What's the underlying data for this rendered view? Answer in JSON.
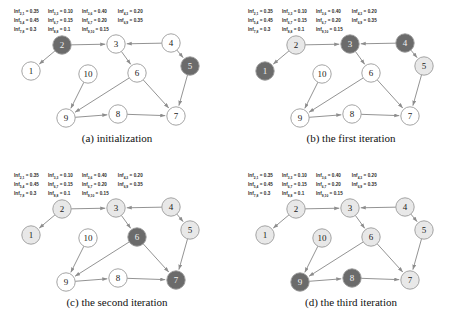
{
  "figure": {
    "node_labels": [
      "1",
      "2",
      "3",
      "4",
      "5",
      "6",
      "7",
      "8",
      "9",
      "10"
    ],
    "edges": [
      {
        "from": "2",
        "to": "1"
      },
      {
        "from": "2",
        "to": "3"
      },
      {
        "from": "4",
        "to": "3"
      },
      {
        "from": "3",
        "to": "6"
      },
      {
        "from": "4",
        "to": "5"
      },
      {
        "from": "6",
        "to": "9"
      },
      {
        "from": "6",
        "to": "7"
      },
      {
        "from": "10",
        "to": "9"
      },
      {
        "from": "9",
        "to": "8"
      },
      {
        "from": "8",
        "to": "7"
      },
      {
        "from": "5",
        "to": "7"
      }
    ]
  },
  "panels": [
    {
      "id": "a",
      "caption": "(a) initialization",
      "active_nodes": [
        "2",
        "5"
      ],
      "faded_nodes": [],
      "weights": [
        {
          "name": "Inf",
          "sub": "2,1",
          "value": "0.35"
        },
        {
          "name": "Inf",
          "sub": "3,3",
          "value": "0.10"
        },
        {
          "name": "Inf",
          "sub": "3,6",
          "value": "0.40"
        },
        {
          "name": "Inf",
          "sub": "4,3",
          "value": "0.20"
        },
        {
          "name": "Inf",
          "sub": "5,4",
          "value": "0.45"
        },
        {
          "name": "Inf",
          "sub": "6,7",
          "value": "0.15"
        },
        {
          "name": "Inf",
          "sub": "6,7",
          "value": "0.20"
        },
        {
          "name": "Inf",
          "sub": "6,9",
          "value": "0.35"
        },
        {
          "name": "Inf",
          "sub": "7,8",
          "value": "0.3"
        },
        {
          "name": "Inf",
          "sub": "8,8",
          "value": "0.1"
        },
        {
          "name": "Inf",
          "sub": "9,10",
          "value": "0.15"
        }
      ]
    },
    {
      "id": "b",
      "caption": "(b) the first iteration",
      "active_nodes": [
        "1",
        "3",
        "4"
      ],
      "faded_nodes": [
        "2",
        "5"
      ],
      "weights": [
        {
          "name": "Inf",
          "sub": "2,1",
          "value": "0.35"
        },
        {
          "name": "Inf",
          "sub": "3,3",
          "value": "0.10"
        },
        {
          "name": "Inf",
          "sub": "3,6",
          "value": "0.40"
        },
        {
          "name": "Inf",
          "sub": "4,3",
          "value": "0.20"
        },
        {
          "name": "Inf",
          "sub": "5,4",
          "value": "0.45"
        },
        {
          "name": "Inf",
          "sub": "6,7",
          "value": "0.15"
        },
        {
          "name": "Inf",
          "sub": "6,7",
          "value": "0.20"
        },
        {
          "name": "Inf",
          "sub": "6,9",
          "value": "0.35"
        },
        {
          "name": "Inf",
          "sub": "7,8",
          "value": "0.3"
        },
        {
          "name": "Inf",
          "sub": "8,8",
          "value": "0.1"
        },
        {
          "name": "Inf",
          "sub": "9,10",
          "value": "0.15"
        }
      ]
    },
    {
      "id": "c",
      "caption": "(c) the second iteration",
      "active_nodes": [
        "6",
        "7"
      ],
      "faded_nodes": [
        "1",
        "2",
        "3",
        "4",
        "5"
      ],
      "weights": [
        {
          "name": "Inf",
          "sub": "2,1",
          "value": "0.35"
        },
        {
          "name": "Inf",
          "sub": "3,3",
          "value": "0.10"
        },
        {
          "name": "Inf",
          "sub": "3,6",
          "value": "0.40"
        },
        {
          "name": "Inf",
          "sub": "4,3",
          "value": "0.20"
        },
        {
          "name": "Inf",
          "sub": "5,4",
          "value": "0.45"
        },
        {
          "name": "Inf",
          "sub": "6,7",
          "value": "0.15"
        },
        {
          "name": "Inf",
          "sub": "6,7",
          "value": "0.20"
        },
        {
          "name": "Inf",
          "sub": "6,9",
          "value": "0.35"
        },
        {
          "name": "Inf",
          "sub": "7,8",
          "value": "0.3"
        },
        {
          "name": "Inf",
          "sub": "8,8",
          "value": "0.1"
        },
        {
          "name": "Inf",
          "sub": "9,10",
          "value": "0.15"
        }
      ]
    },
    {
      "id": "d",
      "caption": "(d) the third iteration",
      "active_nodes": [
        "8",
        "9"
      ],
      "faded_nodes": [
        "1",
        "2",
        "3",
        "4",
        "5",
        "6",
        "7",
        "10"
      ],
      "weights": [
        {
          "name": "Inf",
          "sub": "2,1",
          "value": "0.35"
        },
        {
          "name": "Inf",
          "sub": "3,3",
          "value": "0.10"
        },
        {
          "name": "Inf",
          "sub": "3,6",
          "value": "0.40"
        },
        {
          "name": "Inf",
          "sub": "4,3",
          "value": "0.20"
        },
        {
          "name": "Inf",
          "sub": "5,4",
          "value": "0.45"
        },
        {
          "name": "Inf",
          "sub": "6,7",
          "value": "0.15"
        },
        {
          "name": "Inf",
          "sub": "6,7",
          "value": "0.20"
        },
        {
          "name": "Inf",
          "sub": "6,9",
          "value": "0.35"
        },
        {
          "name": "Inf",
          "sub": "7,8",
          "value": "0.3"
        },
        {
          "name": "Inf",
          "sub": "8,8",
          "value": "0.1"
        },
        {
          "name": "Inf",
          "sub": "9,10",
          "value": "0.15"
        }
      ]
    }
  ],
  "colors": {
    "node_active": "#6b6b6b",
    "node_active_dark": "#5a5a5a",
    "node_faded": "#e8e8e8",
    "node_idle": "#ffffff",
    "node_stroke": "#9a9a9a",
    "edge": "#8d8d8d",
    "text": "#1a1a1a"
  }
}
